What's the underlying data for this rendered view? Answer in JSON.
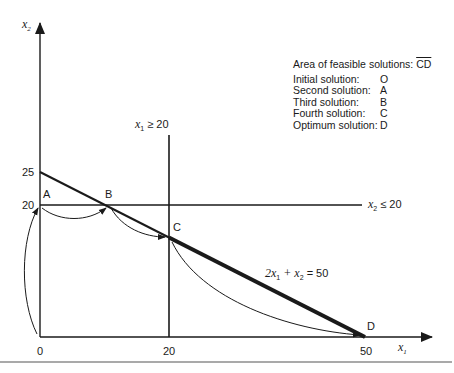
{
  "axes": {
    "x_label": "x",
    "x_sub": "1",
    "y_label": "x",
    "y_sub": "2",
    "x_ticks": [
      "0",
      "20",
      "50"
    ],
    "y_ticks": [
      "20",
      "25"
    ]
  },
  "constraints": {
    "c1": {
      "var": "x",
      "sub": "1",
      "rel": "≥ 20"
    },
    "c2": {
      "var": "x",
      "sub": "2",
      "rel": "≤ 20"
    },
    "c3": {
      "pre": "2x",
      "sub1": "1",
      "mid": " + x",
      "sub2": "2",
      "post": " = 50"
    }
  },
  "points": {
    "A": "A",
    "B": "B",
    "C": "C",
    "D": "D"
  },
  "legend": {
    "title": "Area of feasible solutions: ",
    "title_segment": "CD",
    "rows": [
      {
        "label": "Initial solution:",
        "value": "O"
      },
      {
        "label": "Second solution:",
        "value": "A"
      },
      {
        "label": "Third solution:",
        "value": "B"
      },
      {
        "label": "Fourth solution:",
        "value": "C"
      },
      {
        "label": "Optimum solution:",
        "value": "D"
      }
    ]
  },
  "colors": {
    "ink": "#1a1a1a",
    "rule": "#555555"
  }
}
